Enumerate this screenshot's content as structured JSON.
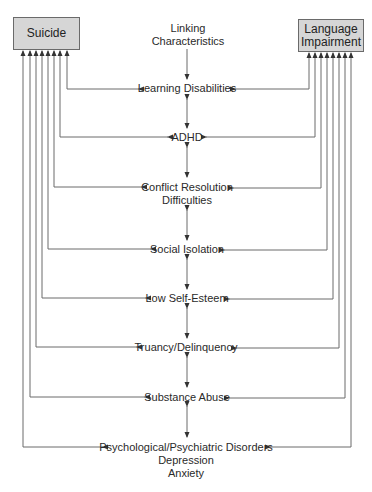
{
  "diagram": {
    "left_box": {
      "label": "Suicide"
    },
    "right_box": {
      "label_line1": "Language",
      "label_line2": "Impairment"
    },
    "header": {
      "line1": "Linking",
      "line2": "Characteristics"
    },
    "characteristics": [
      {
        "lines": [
          "Learning Disabilities"
        ]
      },
      {
        "lines": [
          "ADHD"
        ]
      },
      {
        "lines": [
          "Conflict Resolution",
          "Difficulties"
        ]
      },
      {
        "lines": [
          "Social Isolation"
        ]
      },
      {
        "lines": [
          "Low Self-Esteem"
        ]
      },
      {
        "lines": [
          "Truancy/Delinquency"
        ]
      },
      {
        "lines": [
          "Substance Abuse"
        ]
      },
      {
        "lines": [
          "Psychological/Psychiatric Disorders",
          "Depression",
          "Anxiety"
        ]
      }
    ],
    "colors": {
      "box_fill": "#d6d6d6",
      "line": "#6a6a6a",
      "text": "#2a2a2a"
    }
  }
}
